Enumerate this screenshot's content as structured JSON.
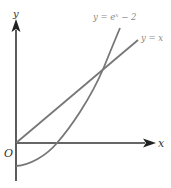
{
  "diagram": {
    "axes": {
      "x_label": "x",
      "y_label": "y",
      "origin_label": "O"
    },
    "curves": [
      {
        "name": "exponential",
        "label": "y = eˣ − 2",
        "label_base": "y = e",
        "label_sup": "x",
        "label_tail": " − 2"
      },
      {
        "name": "line",
        "label": "y = x"
      }
    ],
    "colors": {
      "axis": "#333333",
      "curve": "#777777",
      "label": "#8a8a8a"
    }
  }
}
